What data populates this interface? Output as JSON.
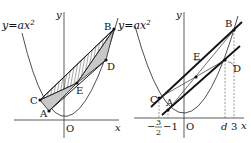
{
  "figures": [
    {
      "name": "left-figure",
      "curve_label": "y=ax",
      "curve_label_exp": "2",
      "axis_x": "x",
      "axis_y": "y",
      "origin": "O",
      "points": {
        "A": "A",
        "B": "B",
        "C": "C",
        "D": "D",
        "E": "E"
      }
    },
    {
      "name": "right-figure",
      "curve_label": "y=ax",
      "curve_label_exp": "2",
      "axis_x": "x",
      "axis_y": "y",
      "origin": "O",
      "points": {
        "A": "A",
        "B": "B",
        "C": "C",
        "D": "D",
        "E": "E"
      },
      "ticks": {
        "neg_frac_sign": "−",
        "neg_frac_num": "3",
        "neg_frac_den": "2",
        "neg_one": "−1",
        "d": "d",
        "three": "3"
      }
    }
  ]
}
